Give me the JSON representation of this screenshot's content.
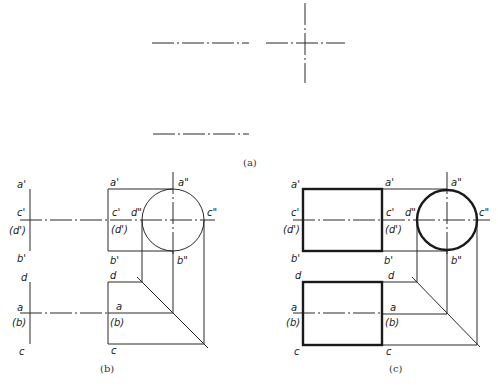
{
  "figure": {
    "captions": {
      "a": "(a)",
      "b": "(b)",
      "c": "(c)"
    },
    "labels": {
      "a_prime": "a'",
      "b_prime": "b'",
      "c_prime": "c'",
      "d_prime_paren": "(d')",
      "a_dprime": "a\"",
      "b_dprime": "b\"",
      "c_dprime": "c\"",
      "d_dprime": "d\"",
      "a": "a",
      "b_paren": "(b)",
      "c": "c",
      "d": "d"
    }
  },
  "colors": {
    "line": "#1a1a1a",
    "background": "#ffffff"
  }
}
